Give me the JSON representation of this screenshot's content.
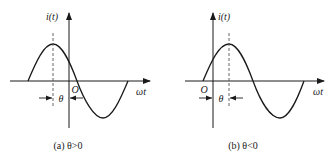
{
  "panels": [
    {
      "id": "a",
      "y_axis_label": "i(t)",
      "x_axis_label": "ωt",
      "origin_label": "O",
      "phase_label": "θ",
      "caption": "(a) θ>0",
      "description": "Sinusoid whose positive peak lies left of the vertical axis (origin O)"
    },
    {
      "id": "b",
      "y_axis_label": "i(t)",
      "x_axis_label": "ωt",
      "origin_label": "O",
      "phase_label": "θ",
      "caption": "(b) θ<0",
      "description": "Sinusoid whose positive peak lies right of the vertical axis (origin O)"
    }
  ],
  "colors": {
    "stroke": "#1a1a1a",
    "dashed": "#555555",
    "background": "#ffffff"
  }
}
